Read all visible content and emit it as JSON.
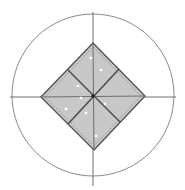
{
  "diagram": {
    "type": "geometric-figure",
    "colors": {
      "background": "#ffffff",
      "circle_stroke": "#8a8a8a",
      "axis_stroke": "#6e6e6e",
      "diamond_fill": "#c8c8c8",
      "diamond_stroke": "#555555",
      "divider_stroke": "#4a4a4a",
      "dashed_stroke": "#8c8c8c",
      "center_dot": "#222222",
      "speck": "#ffffff"
    },
    "circle": {
      "cx": 93,
      "cy": 95,
      "r": 81
    },
    "axes": {
      "vertical": {
        "x": 93,
        "y1": 12,
        "y2": 186
      },
      "horizontal": {
        "y": 97,
        "x1": 10,
        "x2": 176
      }
    },
    "diamond": {
      "top": [
        93,
        43
      ],
      "right": [
        145,
        96
      ],
      "bottom": [
        94,
        150
      ],
      "left": [
        41,
        97
      ]
    },
    "dividers": [
      {
        "from": [
          68,
          70
        ],
        "to": [
          120,
          122
        ]
      },
      {
        "from": [
          119,
          69
        ],
        "to": [
          68,
          124
        ]
      }
    ],
    "center": [
      93,
      96
    ],
    "specks": [
      [
        91,
        58
      ],
      [
        101,
        70
      ],
      [
        78,
        86
      ],
      [
        81,
        98
      ],
      [
        66,
        109
      ],
      [
        86,
        113
      ],
      [
        105,
        104
      ],
      [
        96,
        136
      ]
    ]
  }
}
